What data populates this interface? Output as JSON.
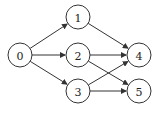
{
  "diagram": {
    "type": "directed-graph",
    "nodes": [
      {
        "id": "0",
        "label": "0",
        "x": 20,
        "y": 55
      },
      {
        "id": "1",
        "label": "1",
        "x": 78,
        "y": 17
      },
      {
        "id": "2",
        "label": "2",
        "x": 78,
        "y": 55
      },
      {
        "id": "3",
        "label": "3",
        "x": 78,
        "y": 91
      },
      {
        "id": "4",
        "label": "4",
        "x": 139,
        "y": 55
      },
      {
        "id": "5",
        "label": "5",
        "x": 139,
        "y": 91
      }
    ],
    "edges": [
      {
        "from": "0",
        "to": "1"
      },
      {
        "from": "0",
        "to": "2"
      },
      {
        "from": "0",
        "to": "3"
      },
      {
        "from": "1",
        "to": "4"
      },
      {
        "from": "2",
        "to": "4"
      },
      {
        "from": "2",
        "to": "5"
      },
      {
        "from": "3",
        "to": "4"
      },
      {
        "from": "3",
        "to": "5"
      }
    ],
    "node_radius": 12,
    "colors": {
      "stroke": "#333333",
      "fill": "#ffffff",
      "text": "#222222"
    }
  }
}
